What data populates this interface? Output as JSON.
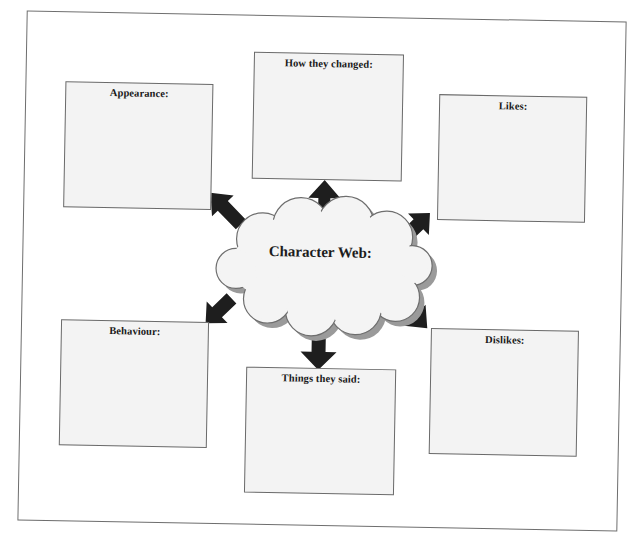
{
  "diagram": {
    "title": "Character Web:",
    "center_shape": "cloud",
    "boxes": [
      {
        "id": "appearance",
        "label": "Appearance:",
        "position": "top-left"
      },
      {
        "id": "how-they-changed",
        "label": "How they changed:",
        "position": "top-center"
      },
      {
        "id": "likes",
        "label": "Likes:",
        "position": "top-right"
      },
      {
        "id": "behaviour",
        "label": "Behaviour:",
        "position": "bottom-left"
      },
      {
        "id": "things-they-said",
        "label": "Things they said:",
        "position": "bottom-center"
      },
      {
        "id": "dislikes",
        "label": "Dislikes:",
        "position": "bottom-right"
      }
    ],
    "arrows": [
      {
        "from": "cloud",
        "to": "appearance",
        "direction": "up-left"
      },
      {
        "from": "cloud",
        "to": "how-they-changed",
        "direction": "up"
      },
      {
        "from": "cloud",
        "to": "likes",
        "direction": "up-right"
      },
      {
        "from": "cloud",
        "to": "behaviour",
        "direction": "down-left"
      },
      {
        "from": "cloud",
        "to": "things-they-said",
        "direction": "down"
      },
      {
        "from": "cloud",
        "to": "dislikes",
        "direction": "down-right"
      }
    ]
  },
  "colors": {
    "box_fill": "#f3f3f3",
    "box_border": "#6a6a6a",
    "arrow_fill": "#1e1e1e",
    "cloud_fill": "#f4f4f4",
    "cloud_shadow": "#9a9a9a",
    "frame_border": "#6e6e6e"
  }
}
